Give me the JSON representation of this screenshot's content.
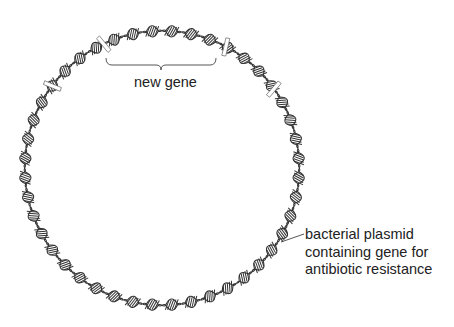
{
  "labels": {
    "new_gene": "new gene",
    "plasmid_line1": "bacterial plasmid",
    "plasmid_line2": "containing gene for",
    "plasmid_line3": "antibiotic resistance"
  },
  "plasmid": {
    "center": [
      162,
      168
    ],
    "radius": 137,
    "segment_count": 44,
    "stroke_color": "#333333",
    "fill_color": "#ffffff",
    "cut_angles_deg": [
      -115,
      -62,
      -143,
      -35
    ]
  },
  "new_gene_bracket": {
    "x1": 106,
    "x2": 216,
    "y": 65
  },
  "leader_line": {
    "x1": 281,
    "y1": 242,
    "x2": 304,
    "y2": 234
  }
}
